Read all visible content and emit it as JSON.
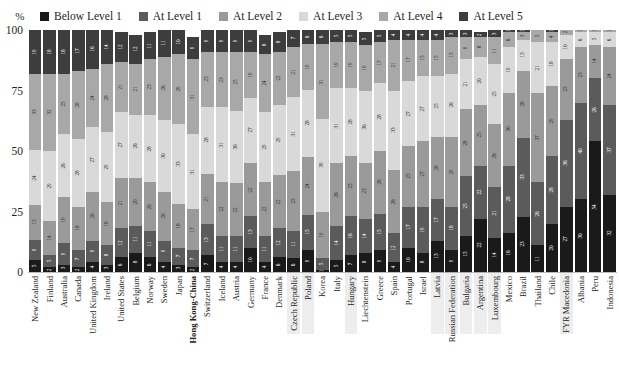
{
  "axis": {
    "unit_label": "%",
    "y_ticks": [
      0,
      25,
      50,
      75,
      100
    ]
  },
  "legend": {
    "items": [
      {
        "label": "Below Level 1",
        "color": "#1a1a1a"
      },
      {
        "label": "At Level 1",
        "color": "#5b5b5b"
      },
      {
        "label": "At Level 2",
        "color": "#9a9a9a"
      },
      {
        "label": "At Level 3",
        "color": "#d9d9d9"
      },
      {
        "label": "At Level 4",
        "color": "#a8a8a8"
      },
      {
        "label": "At Level 5",
        "color": "#3d3d3d"
      }
    ]
  },
  "chart_data": {
    "type": "bar",
    "subtype": "stacked-100-percent",
    "title": "",
    "xlabel": "",
    "ylabel": "%",
    "ylim": [
      0,
      100
    ],
    "yticks": [
      0,
      25,
      50,
      75,
      100
    ],
    "grid": false,
    "legend_position": "top",
    "categories": [
      "New Zealand",
      "Finland",
      "Australia",
      "Canada",
      "United Kingdom",
      "Ireland",
      "United States",
      "Belgium",
      "Norway",
      "Sweden",
      "Japan",
      "Hong Kong-China",
      "Switzerland",
      "Iceland",
      "Austria",
      "Germany",
      "France",
      "Denmark",
      "Czech Republic",
      "Poland",
      "Korea",
      "Italy",
      "Hungary",
      "Liechtenstein",
      "Greece",
      "Spain",
      "Portugal",
      "Israel",
      "Latvia",
      "Russian Federation",
      "Bulgaria",
      "Argentina",
      "Luxembourg",
      "Mexico",
      "Brazil",
      "Thailand",
      "Chile",
      "FYR Macedonia",
      "Albania",
      "Peru",
      "Indonesia"
    ],
    "series": [
      {
        "name": "Below Level 1",
        "color": "#1a1a1a",
        "values": [
          5,
          2,
          3,
          2,
          4,
          3,
          6,
          8,
          6,
          4,
          3,
          2,
          7,
          4,
          4,
          10,
          4,
          6,
          6,
          9,
          1,
          5,
          7,
          8,
          9,
          4,
          10,
          8,
          13,
          9,
          15,
          22,
          14,
          16,
          23,
          11,
          20,
          27,
          30,
          54,
          32
        ]
      },
      {
        "name": "At Level 1",
        "color": "#5b5b5b",
        "values": [
          9,
          5,
          9,
          7,
          9,
          8,
          12,
          11,
          11,
          9,
          7,
          7,
          13,
          11,
          11,
          13,
          11,
          12,
          11,
          15,
          5,
          14,
          16,
          14,
          15,
          12,
          17,
          19,
          17,
          18,
          25,
          22,
          21,
          28,
          33,
          26,
          28,
          36,
          40,
          26,
          37
        ]
      },
      {
        "name": "At Level 2",
        "color": "#9a9a9a",
        "values": [
          15,
          14,
          19,
          18,
          20,
          18,
          21,
          20,
          20,
          20,
          18,
          17,
          21,
          22,
          22,
          22,
          22,
          22,
          25,
          24,
          19,
          26,
          25,
          23,
          26,
          26,
          25,
          27,
          26,
          29,
          28,
          25,
          26,
          30,
          28,
          37,
          29,
          25,
          23,
          14,
          24
        ]
      },
      {
        "name": "At Level 3",
        "color": "#d9d9d9",
        "values": [
          24,
          29,
          26,
          28,
          27,
          29,
          27,
          26,
          28,
          30,
          33,
          31,
          28,
          31,
          30,
          27,
          29,
          29,
          31,
          28,
          39,
          31,
          28,
          30,
          28,
          33,
          27,
          27,
          25,
          26,
          21,
          20,
          25,
          19,
          13,
          21,
          18,
          10,
          6,
          5,
          6
        ]
      },
      {
        "name": "At Level 4",
        "color": "#a8a8a8",
        "values": [
          33,
          32,
          25,
          28,
          24,
          28,
          21,
          21,
          23,
          26,
          29,
          31,
          23,
          23,
          25,
          19,
          24,
          22,
          21,
          19,
          31,
          19,
          19,
          19,
          17,
          21,
          17,
          15,
          15,
          15,
          9,
          8,
          11,
          6,
          3,
          5,
          4,
          2,
          1,
          1,
          1
        ]
      },
      {
        "name": "At Level 5",
        "color": "#3d3d3d",
        "values": [
          19,
          18,
          18,
          17,
          16,
          14,
          12,
          12,
          11,
          11,
          10,
          9,
          9,
          9,
          9,
          9,
          8,
          8,
          7,
          6,
          6,
          5,
          5,
          5,
          5,
          4,
          4,
          4,
          4,
          3,
          3,
          2,
          3,
          1,
          1,
          0,
          1,
          0,
          0,
          0,
          0
        ]
      }
    ]
  },
  "x_label_style": {
    "bold_indices": [
      11
    ],
    "shaded_indices": [
      18,
      19,
      22,
      28,
      29,
      30,
      31,
      32,
      37
    ]
  }
}
